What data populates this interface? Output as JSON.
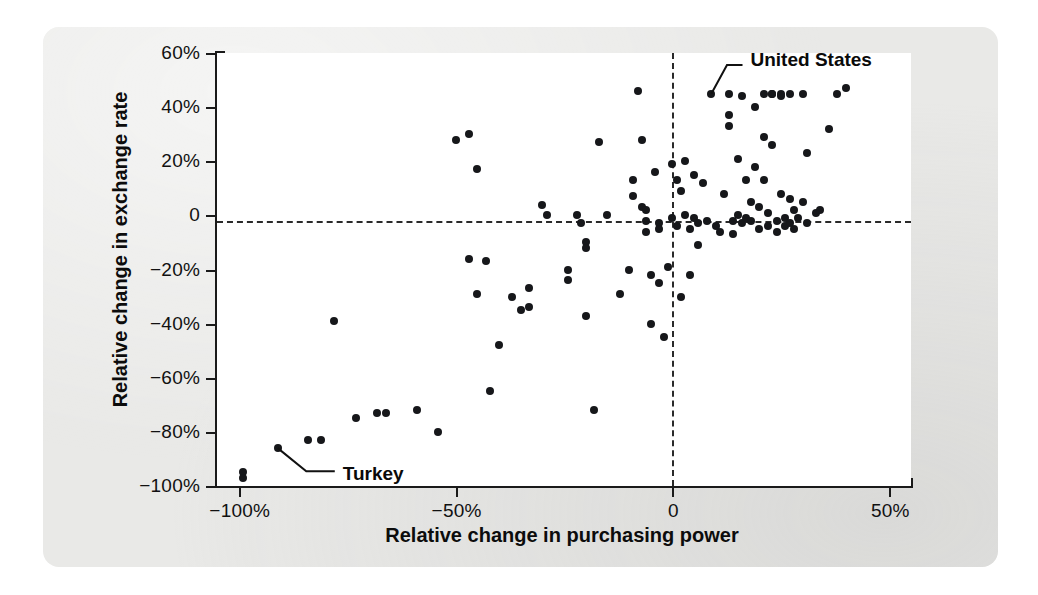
{
  "chart_data": {
    "type": "scatter",
    "title": "",
    "xlabel": "Relative change in purchasing power",
    "ylabel": "Relative change in exchange rate",
    "xlim": [
      -105,
      55
    ],
    "ylim": [
      -100,
      60
    ],
    "xticks": [
      -100,
      -50,
      0,
      50
    ],
    "xtick_labels": [
      "-100%",
      "-50%",
      "0",
      "50%"
    ],
    "yticks": [
      60,
      40,
      20,
      0,
      -20,
      -40,
      -60,
      -80,
      -100
    ],
    "ytick_labels": [
      "60%",
      "40%",
      "20%",
      "0",
      "-20%",
      "-40%",
      "-60%",
      "-80%",
      "-100%"
    ],
    "grid": false,
    "legend": "none",
    "reference_lines": [
      {
        "orientation": "horizontal",
        "value": -2,
        "style": "dashed"
      },
      {
        "orientation": "vertical",
        "value": 0,
        "style": "dashed"
      }
    ],
    "annotations": [
      {
        "text": "United States",
        "point": [
          9,
          45
        ],
        "label_x": 18,
        "label_y": 57
      },
      {
        "text": "Turkey",
        "point": [
          -91,
          -86
        ],
        "label_x": -76,
        "label_y": -96
      }
    ],
    "points": [
      [
        -99,
        -95
      ],
      [
        -99,
        -97
      ],
      [
        -91,
        -86
      ],
      [
        -84,
        -83
      ],
      [
        -81,
        -83
      ],
      [
        -78,
        -39
      ],
      [
        -73,
        -75
      ],
      [
        -68,
        -73
      ],
      [
        -66,
        -73
      ],
      [
        -59,
        -72
      ],
      [
        -54,
        -80
      ],
      [
        -50,
        28
      ],
      [
        -47,
        30
      ],
      [
        -47,
        -16
      ],
      [
        -45,
        17
      ],
      [
        -45,
        -29
      ],
      [
        -43,
        -17
      ],
      [
        -42,
        -65
      ],
      [
        -40,
        -48
      ],
      [
        -37,
        -30
      ],
      [
        -35,
        -35
      ],
      [
        -33,
        -27
      ],
      [
        -33,
        -34
      ],
      [
        -30,
        4
      ],
      [
        -29,
        0
      ],
      [
        -24,
        -20
      ],
      [
        -24,
        -24
      ],
      [
        -22,
        0
      ],
      [
        -21,
        -3
      ],
      [
        -20,
        -10
      ],
      [
        -20,
        -12
      ],
      [
        -20,
        -37
      ],
      [
        -18,
        -72
      ],
      [
        -17,
        27
      ],
      [
        -15,
        0
      ],
      [
        -12,
        -29
      ],
      [
        -10,
        -20
      ],
      [
        -9,
        13
      ],
      [
        -9,
        7
      ],
      [
        -8,
        46
      ],
      [
        -7,
        28
      ],
      [
        -7,
        3
      ],
      [
        -6,
        -2
      ],
      [
        -6,
        2
      ],
      [
        -6,
        -6
      ],
      [
        -5,
        -22
      ],
      [
        -5,
        -40
      ],
      [
        -4,
        16
      ],
      [
        -3,
        -3
      ],
      [
        -3,
        -5
      ],
      [
        -3,
        -25
      ],
      [
        -2,
        -45
      ],
      [
        -1,
        -19
      ],
      [
        0,
        19
      ],
      [
        0,
        -1
      ],
      [
        1,
        13
      ],
      [
        1,
        -4
      ],
      [
        2,
        9
      ],
      [
        2,
        -30
      ],
      [
        3,
        20
      ],
      [
        3,
        0
      ],
      [
        4,
        -5
      ],
      [
        4,
        -22
      ],
      [
        5,
        15
      ],
      [
        5,
        -1
      ],
      [
        6,
        -3
      ],
      [
        6,
        -11
      ],
      [
        7,
        12
      ],
      [
        8,
        -2
      ],
      [
        9,
        45
      ],
      [
        10,
        -4
      ],
      [
        11,
        -6
      ],
      [
        12,
        8
      ],
      [
        13,
        45
      ],
      [
        13,
        37
      ],
      [
        13,
        33
      ],
      [
        14,
        -2
      ],
      [
        14,
        -7
      ],
      [
        15,
        21
      ],
      [
        15,
        0
      ],
      [
        16,
        -3
      ],
      [
        16,
        44
      ],
      [
        17,
        13
      ],
      [
        17,
        -1
      ],
      [
        18,
        5
      ],
      [
        18,
        -2
      ],
      [
        19,
        40
      ],
      [
        19,
        18
      ],
      [
        20,
        3
      ],
      [
        20,
        -5
      ],
      [
        21,
        45
      ],
      [
        21,
        29
      ],
      [
        21,
        13
      ],
      [
        22,
        1
      ],
      [
        22,
        -4
      ],
      [
        23,
        45
      ],
      [
        23,
        45
      ],
      [
        23,
        26
      ],
      [
        24,
        -2
      ],
      [
        24,
        -6
      ],
      [
        25,
        44
      ],
      [
        25,
        45
      ],
      [
        25,
        8
      ],
      [
        26,
        -1
      ],
      [
        26,
        -4
      ],
      [
        27,
        45
      ],
      [
        27,
        6
      ],
      [
        27,
        -3
      ],
      [
        28,
        2
      ],
      [
        28,
        -5
      ],
      [
        29,
        -1
      ],
      [
        30,
        45
      ],
      [
        30,
        5
      ],
      [
        31,
        23
      ],
      [
        31,
        -3
      ],
      [
        33,
        1
      ],
      [
        34,
        2
      ],
      [
        36,
        32
      ],
      [
        38,
        45
      ],
      [
        40,
        47
      ]
    ]
  },
  "axis": {
    "y_title": "Relative change in exchange rate",
    "x_title": "Relative change in purchasing power"
  }
}
